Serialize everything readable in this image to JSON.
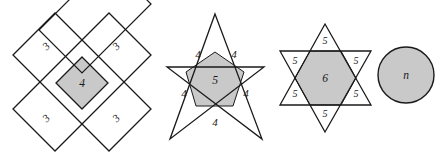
{
  "figure": {
    "colors": {
      "shade_fill": "#c9c9c9",
      "outline": "#1a1a1a",
      "background": "#ffffff",
      "label_color": "#1a1a1a"
    },
    "shapes": [
      {
        "name": "crossed-rectangles",
        "kind": "cross",
        "center_label": "4",
        "point_labels": [
          "3",
          "3",
          "3",
          "3"
        ],
        "shaded_region": "central-square",
        "sides_of_shaded_region": 4,
        "number_of_arms": 4
      },
      {
        "name": "pentagram",
        "kind": "star",
        "center_label": "5",
        "point_labels": [
          "4",
          "4",
          "4",
          "4",
          "4"
        ],
        "shaded_region": "central-pentagon",
        "sides_of_shaded_region": 5,
        "number_of_points": 5
      },
      {
        "name": "hexagram",
        "kind": "star",
        "center_label": "6",
        "point_labels": [
          "5",
          "5",
          "5",
          "5",
          "5",
          "5"
        ],
        "shaded_region": "central-hexagon",
        "sides_of_shaded_region": 6,
        "number_of_points": 6
      },
      {
        "name": "circle",
        "kind": "circle",
        "center_label": "n",
        "point_labels": [],
        "shaded_region": "whole-disc",
        "sides_of_shaded_region": null,
        "number_of_points": 0
      }
    ]
  }
}
